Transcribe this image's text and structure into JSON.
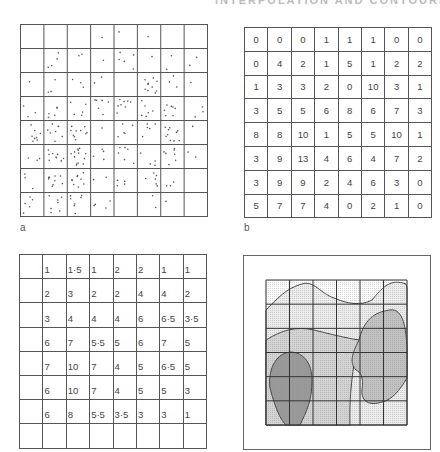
{
  "header": {
    "text": "INTERPOLATION AND CONTOURING"
  },
  "panels": {
    "a": {
      "label": "a",
      "title": "point-distribution",
      "rows": 8,
      "cols": 8,
      "description": "dots per cell correspond to counts in panel b"
    },
    "b": {
      "label": "b",
      "title": "cell-counts",
      "values": [
        [
          "0",
          "0",
          "0",
          "1",
          "1",
          "1",
          "0",
          "0"
        ],
        [
          "0",
          "4",
          "2",
          "1",
          "5",
          "1",
          "2",
          "2"
        ],
        [
          "1",
          "3",
          "3",
          "2",
          "0",
          "10",
          "3",
          "1"
        ],
        [
          "3",
          "5",
          "5",
          "6",
          "8",
          "6",
          "7",
          "3"
        ],
        [
          "8",
          "8",
          "10",
          "1",
          "5",
          "5",
          "10",
          "1"
        ],
        [
          "3",
          "9",
          "13",
          "4",
          "6",
          "4",
          "7",
          "2"
        ],
        [
          "3",
          "9",
          "9",
          "2",
          "4",
          "6",
          "3",
          "0"
        ],
        [
          "5",
          "7",
          "7",
          "4",
          "0",
          "2",
          "1",
          "0"
        ]
      ]
    },
    "c": {
      "label": "",
      "title": "interpolated-node-values",
      "values": [
        [
          "1",
          "1·5",
          "1",
          "2",
          "2",
          "1",
          "1"
        ],
        [
          "2",
          "3",
          "2",
          "2",
          "4",
          "4",
          "2"
        ],
        [
          "3",
          "4",
          "4",
          "4",
          "6",
          "6·5",
          "3·5"
        ],
        [
          "6",
          "7",
          "5·5",
          "5",
          "6",
          "7",
          "5"
        ],
        [
          "7",
          "10",
          "7",
          "4",
          "5",
          "6·5",
          "5"
        ],
        [
          "6",
          "10",
          "7",
          "4",
          "5",
          "5",
          "3"
        ],
        [
          "6",
          "8",
          "5·5",
          "3·5",
          "3",
          "3",
          "1"
        ]
      ]
    },
    "d": {
      "label": "",
      "title": "contour-map",
      "shades": [
        "#e9e9e9",
        "#cfcfcf",
        "#a9a9a9",
        "#878787"
      ]
    }
  }
}
